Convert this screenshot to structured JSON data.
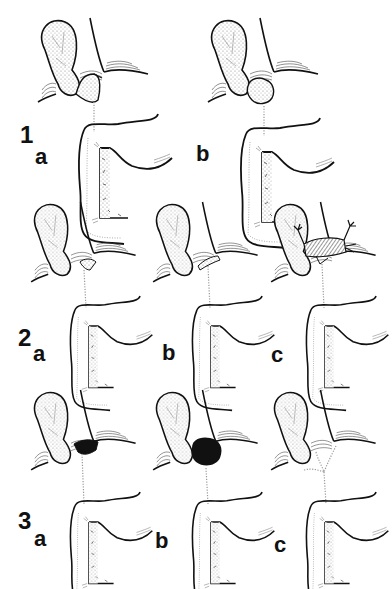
{
  "figure": {
    "rows": [
      {
        "number": "1",
        "panels": [
          {
            "letter": "a",
            "variant": "cystic-duct-loop"
          },
          {
            "letter": "b",
            "variant": "dilated-duct-sac"
          }
        ]
      },
      {
        "number": "2",
        "panels": [
          {
            "letter": "a",
            "variant": "stippled-junction"
          },
          {
            "letter": "b",
            "variant": "parallel-duct"
          },
          {
            "letter": "c",
            "variant": "hatched-cuff-with-branches"
          }
        ]
      },
      {
        "number": "3",
        "panels": [
          {
            "letter": "a",
            "variant": "black-junction-small"
          },
          {
            "letter": "b",
            "variant": "black-junction-large"
          },
          {
            "letter": "c",
            "variant": "forked-duct"
          }
        ]
      }
    ]
  },
  "colors": {
    "ink": "#111111",
    "stipple": "#9a9a9a",
    "background": "#ffffff"
  }
}
